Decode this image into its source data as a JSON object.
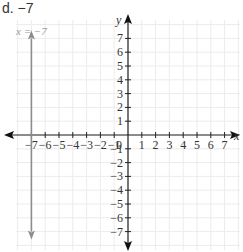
{
  "problem": {
    "label": "d. −7"
  },
  "chart_data": {
    "type": "line",
    "title": "",
    "xlabel": "x",
    "ylabel": "y",
    "xlim": [
      -7,
      7
    ],
    "ylim": [
      -7,
      7
    ],
    "grid": true,
    "x_ticks": [
      -7,
      -6,
      -5,
      -4,
      -3,
      -2,
      -1,
      1,
      2,
      3,
      4,
      5,
      6,
      7
    ],
    "y_ticks": [
      -7,
      -6,
      -5,
      -4,
      -3,
      -2,
      -1,
      1,
      2,
      3,
      4,
      5,
      6,
      7
    ],
    "origin_label": "0",
    "series": [
      {
        "name": "x = −7",
        "kind": "vertical_line",
        "x": -7,
        "y_range": [
          -7,
          7
        ],
        "color": "#8c8c8c",
        "arrows": "both"
      }
    ],
    "annotations": [
      {
        "text": "x = −7",
        "x": -7,
        "y": 7.3,
        "color": "#999999"
      }
    ]
  }
}
